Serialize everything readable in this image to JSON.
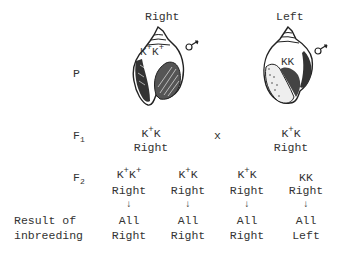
{
  "parents": {
    "row_label": "P",
    "left_parent": {
      "heading": "Right",
      "genotype": "K+K+",
      "sex_symbol": "♂"
    },
    "right_parent": {
      "heading": "Left",
      "genotype": "KK",
      "sex_symbol": "♂"
    }
  },
  "f1": {
    "row_label": "F",
    "row_sub": "1",
    "cross_symbol": "x",
    "left": {
      "genotype_a": "K",
      "genotype_a_sup": "+",
      "genotype_b": "K",
      "phenotype": "Right"
    },
    "right": {
      "genotype_a": "K",
      "genotype_a_sup": "+",
      "genotype_b": "K",
      "phenotype": "Right"
    }
  },
  "f2": {
    "row_label": "F",
    "row_sub": "2",
    "offspring": [
      {
        "a": "K",
        "a_sup": "+",
        "b": "K",
        "b_sup": "+",
        "phenotype": "Right",
        "arrow": "↓",
        "result_1": "All",
        "result_2": "Right"
      },
      {
        "a": "K",
        "a_sup": "+",
        "b": "K",
        "b_sup": "",
        "phenotype": "Right",
        "arrow": "↓",
        "result_1": "All",
        "result_2": "Right"
      },
      {
        "a": "K",
        "a_sup": "+",
        "b": "K",
        "b_sup": "",
        "phenotype": "Right",
        "arrow": "↓",
        "result_1": "All",
        "result_2": "Right"
      },
      {
        "a": "K",
        "a_sup": "",
        "b": "K",
        "b_sup": "",
        "phenotype": "Right",
        "arrow": "↓",
        "result_1": "All",
        "result_2": "Left"
      }
    ]
  },
  "result_label": {
    "line1": "Result of",
    "line2": "inbreeding"
  },
  "parent_genotype_labels": {
    "left_a": "K",
    "left_a_sup": "+",
    "left_b": "K",
    "left_b_sup": "+",
    "right": "KK"
  }
}
